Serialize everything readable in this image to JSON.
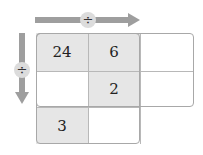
{
  "operators": {
    "horizontal": {
      "symbol": "÷",
      "direction": "right"
    },
    "vertical": {
      "symbol": "÷",
      "direction": "down"
    }
  },
  "grid": {
    "rows": [
      [
        {
          "value": "24",
          "shaded": true
        },
        {
          "value": "6",
          "shaded": true
        },
        {
          "value": "",
          "shaded": false
        }
      ],
      [
        {
          "value": "",
          "shaded": false
        },
        {
          "value": "2",
          "shaded": true
        },
        {
          "value": "",
          "shaded": false
        }
      ],
      [
        {
          "value": "3",
          "shaded": true
        },
        {
          "value": "",
          "shaded": false
        }
      ]
    ]
  },
  "colors": {
    "arrow": "#9e9e9e",
    "shade": "#e6e6e6",
    "border": "#a8a8a8"
  }
}
